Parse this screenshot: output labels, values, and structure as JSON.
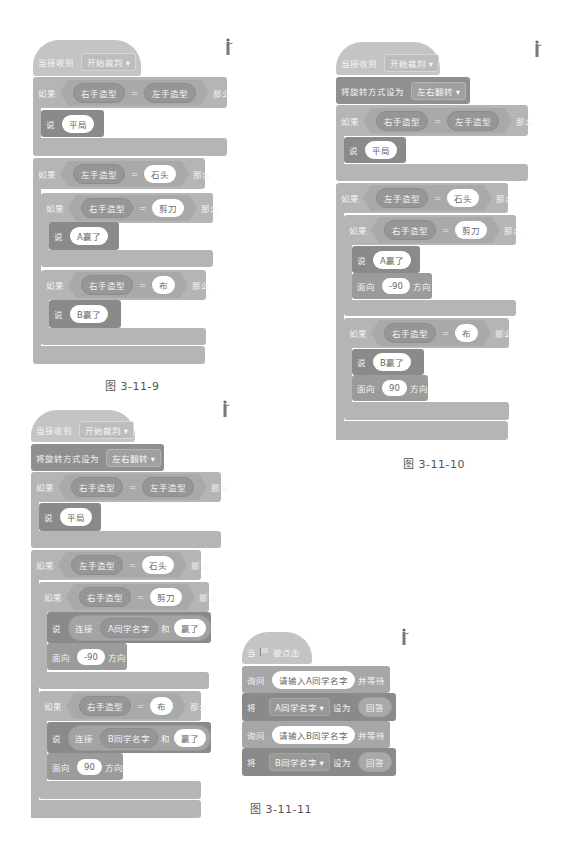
{
  "figures": [
    {
      "caption": "图 3-11-9",
      "hat": {
        "label": "当接收到",
        "message": "开始裁判"
      },
      "if1": {
        "label": "如果",
        "left": "右手造型",
        "op": "=",
        "right": "左手造型",
        "then": "那么",
        "say_label": "说",
        "say_value": "平局"
      },
      "if2": {
        "label": "如果",
        "left": "左手造型",
        "op": "=",
        "right": "石头",
        "then": "那么"
      },
      "inner1": {
        "label": "如果",
        "left": "右手造型",
        "op": "=",
        "right": "剪刀",
        "then": "那么",
        "say_label": "说",
        "say_value": "A赢了"
      },
      "inner2": {
        "label": "如果",
        "left": "右手造型",
        "op": "=",
        "right": "布",
        "then": "那么",
        "say_label": "说",
        "say_value": "B赢了"
      }
    },
    {
      "caption": "图 3-11-10",
      "hat": {
        "label": "当接收到",
        "message": "开始裁判"
      },
      "rotation": {
        "label": "将旋转方式设为",
        "value": "左右翻转"
      },
      "if1": {
        "label": "如果",
        "left": "右手造型",
        "op": "=",
        "right": "左手造型",
        "then": "那么",
        "say_label": "说",
        "say_value": "平局"
      },
      "if2": {
        "label": "如果",
        "left": "左手造型",
        "op": "=",
        "right": "石头",
        "then": "那么"
      },
      "inner1": {
        "label": "如果",
        "left": "右手造型",
        "op": "=",
        "right": "剪刀",
        "then": "那么",
        "say_label": "说",
        "say_value": "A赢了",
        "face_label": "面向",
        "face_value": "-90",
        "face_suffix": "方向"
      },
      "inner2": {
        "label": "如果",
        "left": "右手造型",
        "op": "=",
        "right": "布",
        "then": "那么",
        "say_label": "说",
        "say_value": "B赢了",
        "face_label": "面向",
        "face_value": "90",
        "face_suffix": "方向"
      }
    },
    {
      "caption": "图 3-11-11",
      "hat": {
        "label": "当接收到",
        "message": "开始裁判"
      },
      "rotation": {
        "label": "将旋转方式设为",
        "value": "左右翻转"
      },
      "if1": {
        "label": "如果",
        "left": "右手造型",
        "op": "=",
        "right": "左手造型",
        "then": "那么",
        "say_label": "说",
        "say_value": "平局"
      },
      "if2": {
        "label": "如果",
        "left": "左手造型",
        "op": "=",
        "right": "石头",
        "then": "那么"
      },
      "inner1": {
        "label": "如果",
        "left": "右手造型",
        "op": "=",
        "right": "剪刀",
        "then": "那么",
        "say_label": "说",
        "join_label": "连接",
        "join_var": "A同学名字",
        "join_and": "和",
        "join_text": "赢了",
        "face_label": "面向",
        "face_value": "-90",
        "face_suffix": "方向"
      },
      "inner2": {
        "label": "如果",
        "left": "右手造型",
        "op": "=",
        "right": "布",
        "then": "那么",
        "say_label": "说",
        "join_label": "连接",
        "join_var": "B同学名字",
        "join_and": "和",
        "join_text": "赢了",
        "face_label": "面向",
        "face_value": "90",
        "face_suffix": "方向"
      }
    },
    {
      "hat": {
        "label": "当",
        "icon": "green-flag-icon",
        "suffix": "被点击"
      },
      "ask1": {
        "label": "询问",
        "value": "请输入A同学名字",
        "suffix": "并等待"
      },
      "set1": {
        "label": "将",
        "var": "A同学名字",
        "mid": "设为",
        "value": "回答"
      },
      "ask2": {
        "label": "询问",
        "value": "请输入B同学名字",
        "suffix": "并等待"
      },
      "set2": {
        "label": "将",
        "var": "B同学名字",
        "mid": "设为",
        "value": "回答"
      }
    }
  ]
}
